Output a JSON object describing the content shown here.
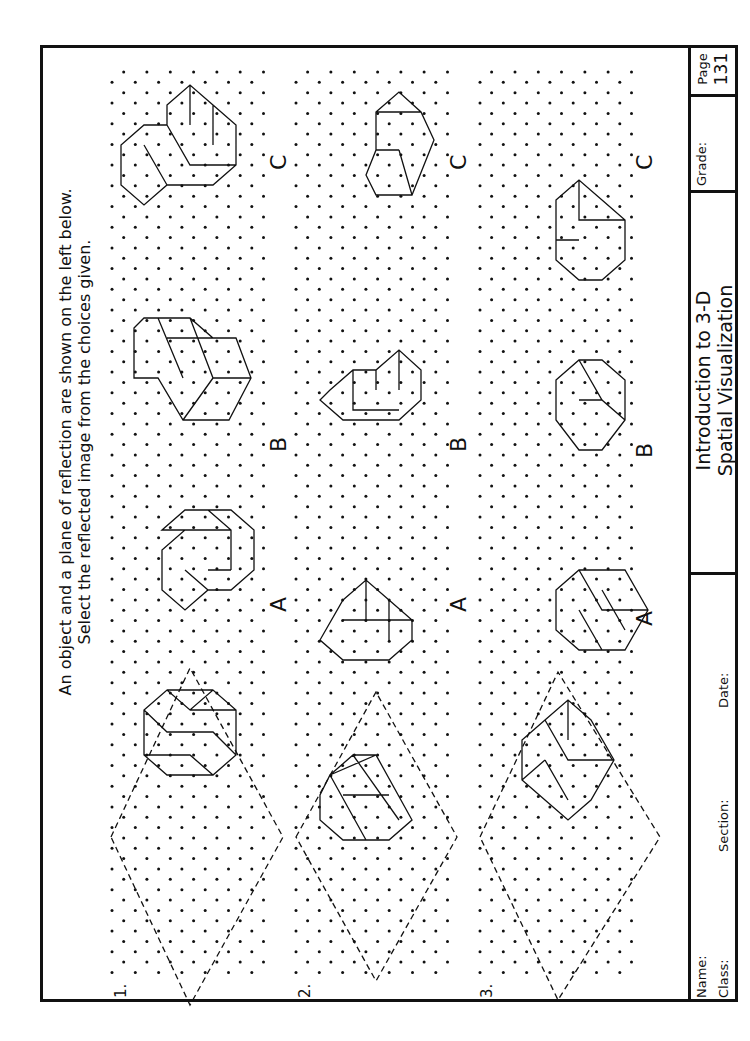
{
  "instructions": {
    "line1": "An object and a plane of reflection are shown on the left below.",
    "line2": "Select the reflected image from the choices given."
  },
  "title_block": {
    "page_label": "Page",
    "page_number": "131",
    "grade_label": "Grade:",
    "course_title_line1": "Introduction to 3-D",
    "course_title_line2": "Spatial Visualization",
    "name_label": "Name:",
    "class_label": "Class:",
    "section_label": "Section:",
    "date_label": "Date:"
  },
  "problems": [
    {
      "number": "1.",
      "options": [
        "A",
        "B",
        "C"
      ],
      "strip_x": 112,
      "label_x": 268,
      "num_y": 985,
      "option_label_y": [
        605,
        445,
        162
      ]
    },
    {
      "number": "2.",
      "options": [
        "A",
        "B",
        "C"
      ],
      "strip_x": 296,
      "label_x": 452,
      "num_y": 985,
      "option_label_y": [
        605,
        445,
        162
      ]
    },
    {
      "number": "3.",
      "options": [
        "A",
        "B",
        "C"
      ],
      "strip_x": 480,
      "label_x": 636,
      "num_y": 985,
      "option_label_y": [
        605,
        445,
        162
      ]
    }
  ],
  "colors": {
    "ink": "#111111",
    "paper": "#ffffff"
  }
}
